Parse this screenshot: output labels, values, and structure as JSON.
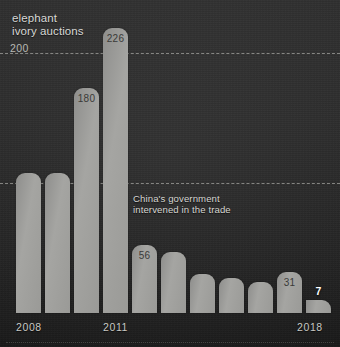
{
  "title": "elephant\nivory auctions",
  "annotation": "China's government\nintervened in the trade",
  "colors": {
    "background": "#2b2b2b",
    "bar": "#9a9a97",
    "text": "#d8d8d6",
    "gridline": "#cdcdc8",
    "highlight_label": "#ffffff"
  },
  "axis": {
    "x_ticks": [
      {
        "label": "2008",
        "left_px": 16
      },
      {
        "label": "2011",
        "left_px": 103
      },
      {
        "label": "2018",
        "left_px": 297
      }
    ],
    "gridlines": [
      {
        "label": "200",
        "value": 200,
        "top_px": 53
      },
      {
        "label": "",
        "value": 100,
        "top_px": 183
      }
    ]
  },
  "chart_data": {
    "type": "bar",
    "title": "elephant ivory auctions",
    "subtitle": "",
    "xlabel": "",
    "ylabel": "",
    "ylim": [
      0,
      240
    ],
    "grid": true,
    "legend": "none",
    "categories": [
      "2008",
      "2009",
      "2010",
      "2011",
      "2012",
      "2013",
      "2014",
      "2015",
      "2016",
      "2017",
      "2018"
    ],
    "values": [
      108,
      108,
      180,
      226,
      56,
      52,
      30,
      27,
      24,
      31,
      7
    ],
    "labeled_values": {
      "2010": "180",
      "2011": "226",
      "2012": "56",
      "2017": "31",
      "2018": "7"
    },
    "annotations": [
      {
        "text": "China's government intervened in the trade",
        "near_category": "2012"
      }
    ]
  },
  "bars": [
    {
      "year": "2008",
      "value": 108,
      "label": "",
      "left": 16,
      "width": 25,
      "top": 173,
      "label_style": "none"
    },
    {
      "year": "2009",
      "value": 108,
      "label": "",
      "left": 45,
      "width": 25,
      "top": 173,
      "label_style": "none"
    },
    {
      "year": "2010",
      "value": 180,
      "label": "180",
      "left": 74,
      "width": 25,
      "top": 88,
      "label_style": "inside"
    },
    {
      "year": "2011",
      "value": 226,
      "label": "226",
      "left": 103,
      "width": 25,
      "top": 28,
      "label_style": "inside"
    },
    {
      "year": "2012",
      "value": 56,
      "label": "56",
      "left": 132,
      "width": 25,
      "top": 245,
      "label_style": "inside"
    },
    {
      "year": "2013",
      "value": 52,
      "label": "",
      "left": 161,
      "width": 25,
      "top": 252,
      "label_style": "none"
    },
    {
      "year": "2014",
      "value": 30,
      "label": "",
      "left": 190,
      "width": 25,
      "top": 274,
      "label_style": "none"
    },
    {
      "year": "2015",
      "value": 27,
      "label": "",
      "left": 219,
      "width": 25,
      "top": 278,
      "label_style": "none"
    },
    {
      "year": "2016",
      "value": 24,
      "label": "",
      "left": 248,
      "width": 25,
      "top": 282,
      "label_style": "none"
    },
    {
      "year": "2017",
      "value": 31,
      "label": "31",
      "left": 277,
      "width": 25,
      "top": 272,
      "label_style": "inside"
    },
    {
      "year": "2018",
      "value": 7,
      "label": "7",
      "left": 306,
      "width": 25,
      "top": 300,
      "label_style": "above"
    }
  ]
}
